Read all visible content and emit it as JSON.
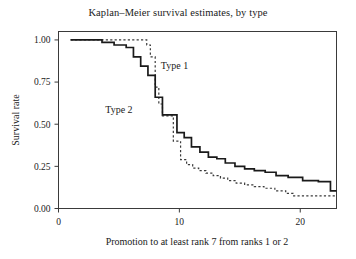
{
  "chart_data": {
    "type": "line",
    "title": "Kaplan–Meier survival estimates, by type",
    "xlabel": "Promotion to at least rank 7 from ranks 1 or 2",
    "ylabel": "Survival rate",
    "xlim": [
      0,
      23
    ],
    "ylim": [
      0,
      1.05
    ],
    "xticks": [
      0,
      10,
      20
    ],
    "xtick_labels": [
      "0",
      "10",
      "20"
    ],
    "yticks": [
      0.0,
      0.25,
      0.5,
      0.75,
      1.0
    ],
    "ytick_labels": [
      "0.00",
      "0.25",
      "0.50",
      "0.75",
      "1.00"
    ],
    "grid": false,
    "legend_position": "inline-annotations",
    "step_style": "post",
    "series": [
      {
        "name": "Type 1",
        "style": "dashed",
        "color": "#3a3a3a",
        "annotation": "Type 1",
        "annotation_x": 9.6,
        "annotation_y": 0.83,
        "x": [
          1.0,
          5.5,
          7.3,
          7.6,
          8.0,
          8.3,
          8.6,
          9.0,
          9.5,
          10.1,
          10.6,
          11.1,
          11.6,
          12.2,
          12.8,
          13.4,
          14.0,
          14.7,
          15.4,
          16.2,
          17.0,
          17.9,
          18.8,
          19.4,
          23.0
        ],
        "y": [
          1.0,
          1.0,
          0.97,
          0.9,
          0.72,
          0.62,
          0.55,
          0.55,
          0.4,
          0.29,
          0.26,
          0.24,
          0.225,
          0.21,
          0.195,
          0.18,
          0.165,
          0.15,
          0.14,
          0.13,
          0.12,
          0.105,
          0.09,
          0.075,
          0.075
        ]
      },
      {
        "name": "Type 2",
        "style": "solid",
        "color": "#1a1a1a",
        "annotation": "Type 2",
        "annotation_x": 5.0,
        "annotation_y": 0.565,
        "x": [
          1.0,
          3.6,
          4.6,
          5.6,
          6.2,
          6.8,
          7.4,
          8.0,
          8.6,
          9.2,
          9.8,
          10.4,
          11.0,
          11.7,
          12.4,
          13.1,
          13.8,
          14.6,
          15.4,
          16.2,
          17.1,
          18.0,
          19.0,
          20.2,
          21.5,
          22.5,
          23.0
        ],
        "y": [
          1.0,
          0.985,
          0.97,
          0.955,
          0.9,
          0.845,
          0.79,
          0.66,
          0.555,
          0.555,
          0.45,
          0.42,
          0.365,
          0.335,
          0.305,
          0.295,
          0.27,
          0.25,
          0.235,
          0.225,
          0.215,
          0.195,
          0.185,
          0.165,
          0.16,
          0.105,
          0.105
        ]
      }
    ]
  }
}
